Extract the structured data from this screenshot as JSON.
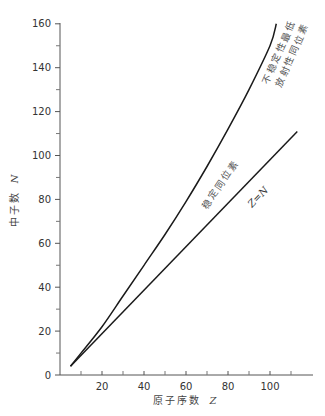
{
  "chart_data": {
    "type": "line",
    "title": "",
    "xlabel": "原子序数 Z",
    "ylabel": "中子数 N",
    "xlim": [
      0,
      120
    ],
    "ylim": [
      0,
      160
    ],
    "x_ticks": [
      20,
      40,
      60,
      80,
      100
    ],
    "x_minor_ticks": [
      10,
      30,
      50,
      70,
      90,
      110
    ],
    "y_ticks": [
      0,
      20,
      40,
      60,
      80,
      100,
      120,
      140,
      160
    ],
    "y_minor_ticks": [
      10,
      30,
      50,
      70,
      90,
      110,
      130,
      150
    ],
    "grid": false,
    "legend": null,
    "series": [
      {
        "name": "稳定同位素",
        "x": [
          5,
          10,
          20,
          30,
          40,
          50,
          60,
          70,
          80,
          90,
          100,
          103
        ],
        "y": [
          4,
          10,
          22,
          36,
          50,
          64,
          79,
          95,
          112,
          130,
          150,
          160
        ],
        "color": "#1a1a1a"
      },
      {
        "name": "Z=N",
        "x": [
          5,
          113
        ],
        "y": [
          4,
          111
        ],
        "color": "#1a1a1a"
      }
    ],
    "annotations": [
      {
        "text": "稳定同位素",
        "target": "curve",
        "position": "along curve mid-upper"
      },
      {
        "text": "Z=N",
        "target": "straight line",
        "position": "along line middle"
      },
      {
        "text": "不稳定性最低",
        "target": "curve",
        "position": "right of curve top"
      },
      {
        "text": "放射性同位素",
        "target": "curve",
        "position": "right of curve top (second line)"
      }
    ]
  },
  "labels": {
    "x_axis_title": "原子序数",
    "x_axis_var": "Z",
    "y_axis_title": "中子数",
    "y_axis_var": "N",
    "annot_stable": "稳定同位素",
    "annot_zn": "Z=N",
    "annot_top_line1": "不稳定性最低",
    "annot_top_line2": "放射性同位素"
  }
}
